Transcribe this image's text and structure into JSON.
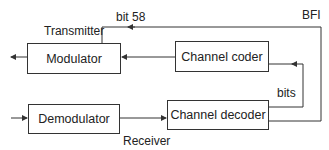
{
  "blocks": {
    "modulator": "Modulator",
    "channel_coder": "Channel coder",
    "demodulator": "Demodulator",
    "channel_decoder": "Channel decoder"
  },
  "labels": {
    "transmitter": "Transmitter",
    "bit58": "bit 58",
    "bfi": "BFI",
    "bits": "bits",
    "receiver": "Receiver"
  },
  "colors": {
    "line": "#333333",
    "background": "#ffffff"
  }
}
